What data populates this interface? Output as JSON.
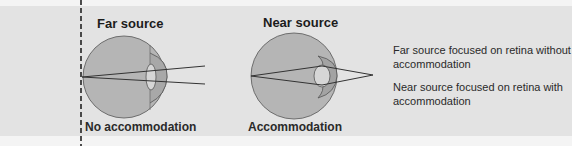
{
  "figure": {
    "left_panel": {
      "title": "Far source",
      "caption": "No accommodation"
    },
    "right_panel": {
      "title": "Near source",
      "caption": "Accommodation"
    },
    "legend": {
      "far": "Far source focused on retina without accommodation",
      "near": "Near source focused on retina with accommodation"
    },
    "colors": {
      "eyeball": "#b5b5b5",
      "cornea": "#a3a3a3",
      "lens": "#d6d6d6",
      "background": "#e3e3e3",
      "lines": "#333333"
    }
  }
}
